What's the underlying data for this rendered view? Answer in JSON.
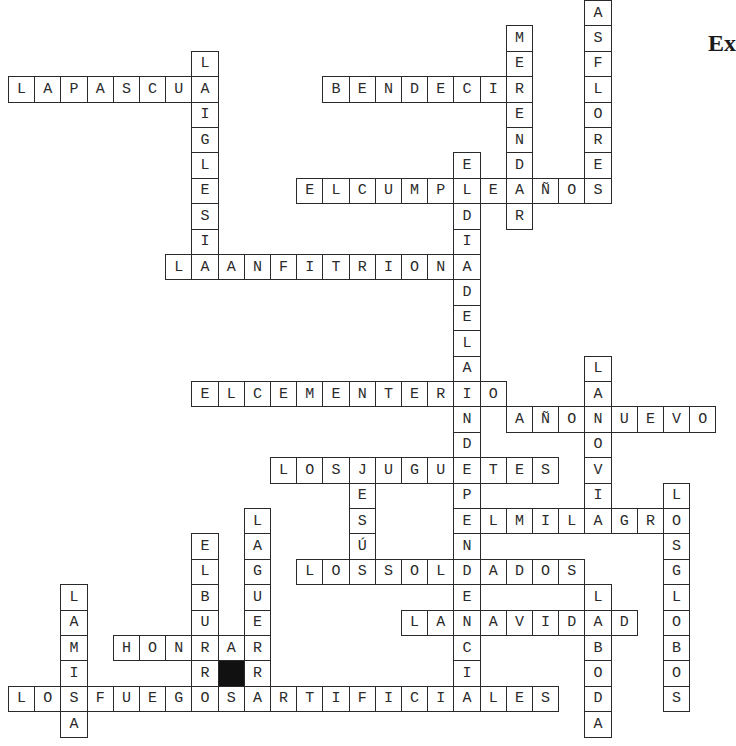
{
  "heading": "Ex",
  "grid": {
    "origin_x": 8,
    "origin_y": 0,
    "cell_w": 26.2,
    "cell_h": 25.4,
    "ink_color": "#2a2a2a",
    "black_color": "#111111"
  },
  "words": {
    "across": [
      {
        "answer": "LAPASCUA",
        "row": 3,
        "col": 0
      },
      {
        "answer": "BENDECIR",
        "row": 3,
        "col": 12
      },
      {
        "answer": "ELCUMPLEAÑOS",
        "row": 7,
        "col": 11
      },
      {
        "answer": "LAANFITRIONA",
        "row": 10,
        "col": 6
      },
      {
        "answer": "ELCEMENTERIO",
        "row": 15,
        "col": 7
      },
      {
        "answer": "AÑONUEVO",
        "row": 16,
        "col": 19
      },
      {
        "answer": "LOSJUGUETES",
        "row": 18,
        "col": 10
      },
      {
        "answer": "ELMILAGRO",
        "row": 20,
        "col": 17
      },
      {
        "answer": "LOSSOLDADOS",
        "row": 22,
        "col": 11
      },
      {
        "answer": "LANAVIDAD",
        "row": 24,
        "col": 15
      },
      {
        "answer": "HONRAR",
        "row": 25,
        "col": 4
      },
      {
        "answer": "LOSFUEGOSARTIFICIALES",
        "row": 27,
        "col": 0
      }
    ],
    "down": [
      {
        "answer": "LAIGLESIA",
        "row": 2,
        "col": 7
      },
      {
        "answer": "MERENDAR",
        "row": 1,
        "col": 19
      },
      {
        "answer": "LASFLORES",
        "row": -1,
        "col": 22
      },
      {
        "answer": "ELDIADELAINDEPENDENCIA",
        "row": 6,
        "col": 17
      },
      {
        "answer": "LANOVIA",
        "row": 14,
        "col": 22
      },
      {
        "answer": "LOSGLOBOS",
        "row": 19,
        "col": 25
      },
      {
        "answer": "LABODA",
        "row": 23,
        "col": 22
      },
      {
        "answer": "JESÚS",
        "row": 18,
        "col": 13
      },
      {
        "answer": "ELBURRO",
        "row": 21,
        "col": 7
      },
      {
        "answer": "LAGUERRA",
        "row": 20,
        "col": 9
      },
      {
        "answer": "LAMISA",
        "row": 23,
        "col": 2
      }
    ]
  },
  "black_cells": [
    {
      "row": 26,
      "col": 8
    }
  ]
}
